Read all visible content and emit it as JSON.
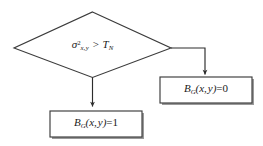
{
  "diagram": {
    "type": "flowchart",
    "background_color": "#ffffff",
    "stroke_color": "#3b3b3b",
    "text_color": "#1a1a1a",
    "shadow_color": "#808080",
    "nodes": [
      {
        "id": "decision",
        "shape": "diamond",
        "text": "σ²x,y > TN",
        "expression": {
          "left_symbol": "σ",
          "left_superscript": "2",
          "left_subscript": "x, y",
          "operator": ">",
          "right_symbol": "T",
          "right_subscript": "N"
        }
      },
      {
        "id": "box-true",
        "shape": "rectangle",
        "text": "BG(x, y)=1",
        "expression": {
          "symbol": "B",
          "subscript": "G",
          "arguments": "(x, y)",
          "equals": "=",
          "value": "1"
        }
      },
      {
        "id": "box-false",
        "shape": "rectangle",
        "text": "BG(x, y)=0",
        "expression": {
          "symbol": "B",
          "subscript": "G",
          "arguments": "(x, y)",
          "equals": "=",
          "value": "0"
        }
      }
    ],
    "edges": [
      {
        "id": "edge-true",
        "from": "decision",
        "to": "box-true",
        "label": "",
        "route": "vertical-down",
        "arrowhead": true
      },
      {
        "id": "edge-false",
        "from": "decision",
        "to": "box-false",
        "label": "",
        "route": "right-then-down",
        "arrowhead": true
      }
    ]
  }
}
